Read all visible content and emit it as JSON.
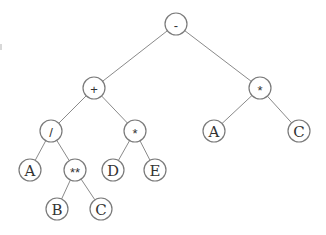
{
  "diagram": {
    "type": "expression-tree",
    "node_radius": 11,
    "colors": {
      "edge": "#8a8a8a",
      "node_outline": "#7a7a7a",
      "label": "#333333",
      "background": "#ffffff"
    },
    "nodes": [
      {
        "id": "n0",
        "label": "-",
        "x": 176,
        "y": 24,
        "kind": "op"
      },
      {
        "id": "n1",
        "label": "+",
        "x": 94,
        "y": 88,
        "kind": "op"
      },
      {
        "id": "n2",
        "label": "*",
        "x": 260,
        "y": 88,
        "kind": "op"
      },
      {
        "id": "n3",
        "label": "/",
        "x": 51,
        "y": 131,
        "kind": "op"
      },
      {
        "id": "n4",
        "label": "*",
        "x": 135,
        "y": 131,
        "kind": "op"
      },
      {
        "id": "n5",
        "label": "A",
        "x": 214,
        "y": 131,
        "kind": "var"
      },
      {
        "id": "n6",
        "label": "C",
        "x": 299,
        "y": 131,
        "kind": "var"
      },
      {
        "id": "n7",
        "label": "A",
        "x": 30,
        "y": 170,
        "kind": "var"
      },
      {
        "id": "n8",
        "label": "**",
        "x": 75,
        "y": 170,
        "kind": "op"
      },
      {
        "id": "n9",
        "label": "D",
        "x": 113,
        "y": 170,
        "kind": "var"
      },
      {
        "id": "n10",
        "label": "E",
        "x": 155,
        "y": 170,
        "kind": "var"
      },
      {
        "id": "n11",
        "label": "B",
        "x": 57,
        "y": 209,
        "kind": "var"
      },
      {
        "id": "n12",
        "label": "C",
        "x": 101,
        "y": 209,
        "kind": "var"
      }
    ],
    "edges": [
      [
        "n0",
        "n1"
      ],
      [
        "n0",
        "n2"
      ],
      [
        "n1",
        "n3"
      ],
      [
        "n1",
        "n4"
      ],
      [
        "n2",
        "n5"
      ],
      [
        "n2",
        "n6"
      ],
      [
        "n3",
        "n7"
      ],
      [
        "n3",
        "n8"
      ],
      [
        "n4",
        "n9"
      ],
      [
        "n4",
        "n10"
      ],
      [
        "n8",
        "n11"
      ],
      [
        "n8",
        "n12"
      ]
    ]
  }
}
